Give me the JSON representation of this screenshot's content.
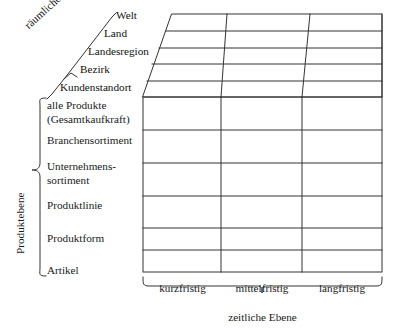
{
  "diagram": {
    "axes": {
      "spatial_caption": "räumliche Ebene",
      "product_caption": "Produktebene",
      "time_caption": "zeitliche Ebene"
    },
    "spatial_levels": [
      "Welt",
      "Land",
      "Landesregion",
      "Bezirk",
      "Kundenstandort"
    ],
    "product_levels": [
      "alle Produkte\n(Gesamtkaufkraft)",
      "Branchensortiment",
      "Unternehmens-\nsortiment",
      "Produktlinie",
      "Produktform",
      "Artikel"
    ],
    "product_levels_lines": [
      [
        "alle Produkte",
        "(Gesamtkaufkraft)"
      ],
      [
        "Branchensortiment"
      ],
      [
        "Unternehmens-",
        "sortiment"
      ],
      [
        "Produktlinie"
      ],
      [
        "Produktform"
      ],
      [
        "Artikel"
      ]
    ],
    "time_levels": [
      "kurzfristig",
      "mittelfristig",
      "langfristig"
    ],
    "colors": {
      "line": "#333333",
      "text": "#111111",
      "background": "#ffffff"
    }
  }
}
